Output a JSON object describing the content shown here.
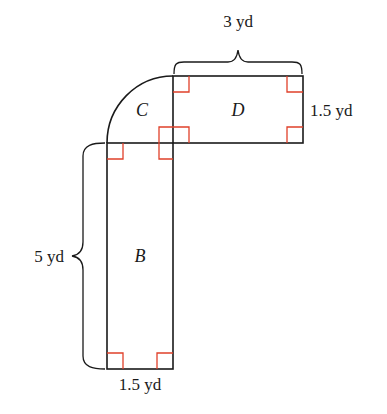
{
  "figure": {
    "type": "composite-area-diagram",
    "regions": [
      {
        "id": "C",
        "label": "C",
        "shape": "quarter-circle"
      },
      {
        "id": "D",
        "label": "D",
        "shape": "rectangle"
      },
      {
        "id": "B",
        "label": "B",
        "shape": "rectangle"
      }
    ],
    "dimensions": {
      "top_width": "3 yd",
      "right_height": "1.5 yd",
      "left_height": "5 yd",
      "bottom_width": "1.5 yd"
    },
    "colors": {
      "outline": "#1a1a1a",
      "right_angle_marker": "#e0402a"
    }
  }
}
